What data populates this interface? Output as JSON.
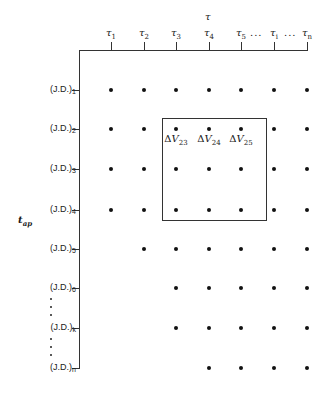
{
  "diagram": {
    "top_axis_title": "τ",
    "left_axis_title": {
      "base": "t",
      "sub": "ap"
    },
    "columns": [
      {
        "base": "τ",
        "sub": "1",
        "x": 111
      },
      {
        "base": "τ",
        "sub": "2",
        "x": 144
      },
      {
        "base": "τ",
        "sub": "3",
        "x": 176
      },
      {
        "base": "τ",
        "sub": "4",
        "x": 209
      },
      {
        "base": "τ",
        "sub": "5",
        "x": 241
      },
      {
        "base": "τ",
        "sub": "i",
        "x": 274
      },
      {
        "base": "τ",
        "sub": "n",
        "x": 307
      }
    ],
    "ellipsis": "...",
    "rows": [
      {
        "label": "(J.D.)",
        "sub": "1",
        "y": 90,
        "first_col": 1
      },
      {
        "label": "(J.D.)",
        "sub": "2",
        "y": 129,
        "first_col": 1
      },
      {
        "label": "(J.D.)",
        "sub": "3",
        "y": 169,
        "first_col": 1
      },
      {
        "label": "(J.D.)",
        "sub": "4",
        "y": 210,
        "first_col": 1
      },
      {
        "label": "(J.D.)",
        "sub": "5",
        "y": 249,
        "first_col": 2
      },
      {
        "label": "(J.D.)",
        "sub": "6",
        "y": 288,
        "first_col": 3
      },
      {
        "label": "(J.D.)",
        "sub": "k",
        "y": 328,
        "first_col": 3
      },
      {
        "label": "(J.D.)",
        "sub": "n",
        "y": 368,
        "first_col": 4
      }
    ],
    "highlight_box": {
      "labels": [
        {
          "delta": "Δ",
          "base": "V",
          "sub": "23",
          "x": 176
        },
        {
          "delta": "Δ",
          "base": "V",
          "sub": "24",
          "x": 209
        },
        {
          "delta": "Δ",
          "base": "V",
          "sub": "25",
          "x": 241
        }
      ]
    }
  }
}
